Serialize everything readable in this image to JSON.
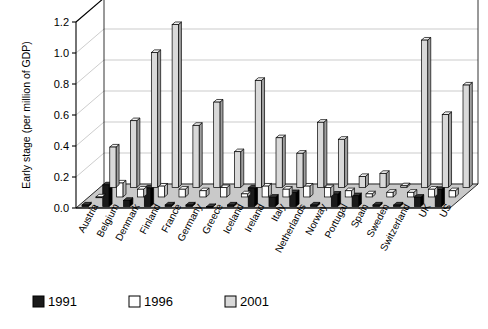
{
  "chart_data": {
    "type": "bar",
    "title": "",
    "xlabel": "",
    "ylabel": "Early stage (per million of GDP)",
    "ylim": [
      0.0,
      1.2
    ],
    "yticks": [
      0.0,
      0.2,
      0.4,
      0.6,
      0.8,
      1.0,
      1.2
    ],
    "ytick_labels": [
      "0.0",
      "0.2",
      "0.4",
      "0.6",
      "0.8",
      "1.0",
      "1.2"
    ],
    "grid": true,
    "legend_position": "bottom-left",
    "threed": true,
    "categories": [
      "Austria",
      "Belgium",
      "Denmark",
      "Finland",
      "France",
      "Germany",
      "Greece",
      "Iceland",
      "Ireland",
      "Italy",
      "Netherlands",
      "Norway",
      "Portugal",
      "Spain",
      "Sweden",
      "Switzerland",
      "UK",
      "US"
    ],
    "series": [
      {
        "name": "1991",
        "color": "#1a1a1a",
        "values": [
          0.01,
          0.14,
          0.04,
          0.12,
          0.01,
          0.01,
          0.0,
          0.01,
          0.12,
          0.06,
          0.09,
          0.01,
          0.08,
          0.07,
          0.01,
          0.01,
          0.06,
          0.11
        ]
      },
      {
        "name": "1996",
        "color": "#ffffff",
        "values": [
          0.0,
          0.09,
          0.05,
          0.07,
          0.05,
          0.04,
          0.06,
          0.02,
          0.07,
          0.05,
          0.07,
          0.06,
          0.04,
          0.02,
          0.03,
          0.03,
          0.05,
          0.04
        ]
      },
      {
        "name": "2001",
        "color": "#d9d9d9",
        "values": [
          0.26,
          0.43,
          0.87,
          1.05,
          0.4,
          0.55,
          0.23,
          0.69,
          0.32,
          0.22,
          0.42,
          0.31,
          0.07,
          0.09,
          0.01,
          0.95,
          0.47,
          0.66
        ]
      }
    ]
  },
  "legend": {
    "items": [
      {
        "label": "1991",
        "color": "#1a1a1a"
      },
      {
        "label": "1996",
        "color": "#ffffff"
      },
      {
        "label": "2001",
        "color": "#d9d9d9"
      }
    ]
  }
}
